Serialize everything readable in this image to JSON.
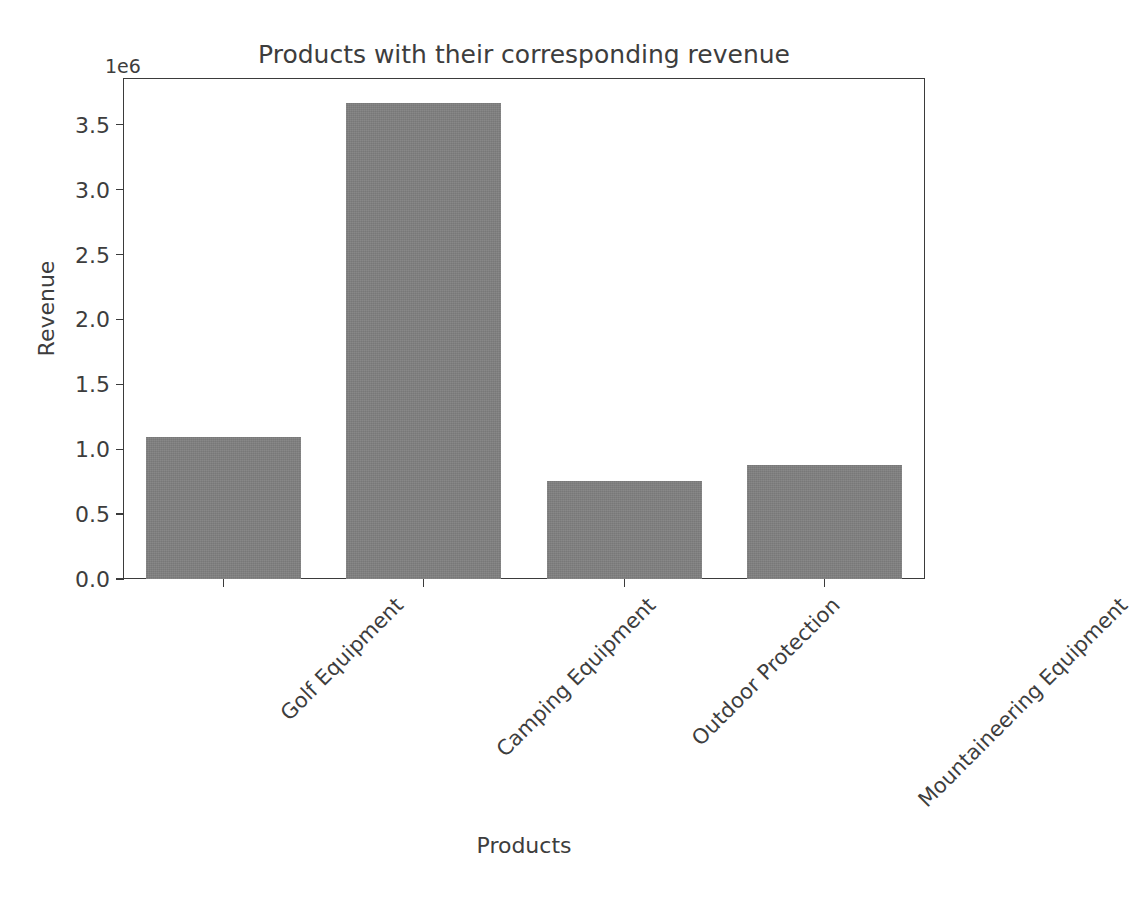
{
  "chart_data": {
    "type": "bar",
    "title": "Products with their corresponding revenue",
    "xlabel": "Products",
    "ylabel": "Revenue",
    "categories": [
      "Golf Equipment",
      "Camping Equipment",
      "Outdoor Protection",
      "Mountaineering Equipment"
    ],
    "values": [
      1095000,
      3665000,
      753000,
      876000
    ],
    "ylim": [
      0,
      3860000
    ],
    "y_tick_values": [
      0,
      500000,
      1000000,
      1500000,
      2000000,
      2500000,
      3000000,
      3500000
    ],
    "y_tick_labels": [
      "0.0",
      "0.5",
      "1.0",
      "1.5",
      "2.0",
      "2.5",
      "3.0",
      "3.5"
    ],
    "y_offset_label": "1e6",
    "grid": false,
    "legend": null,
    "bar_color": "#808080",
    "axis_color": "#3b3b3b",
    "text_color": "#3d3d3d",
    "x_tick_label_rotation": "-45",
    "background_color": "#ffffff"
  },
  "clipped_top_fragment": "                                               "
}
